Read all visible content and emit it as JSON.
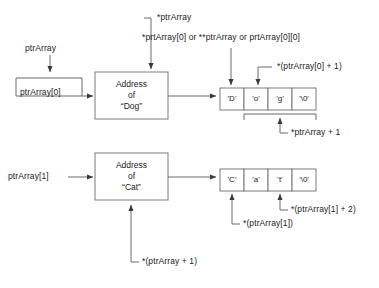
{
  "diagram": {
    "colors": {
      "line": "#6b6b6b",
      "box_border": "#7a7a7a",
      "arrow": "#3a3a3a",
      "text": "#1a1a1a",
      "background": "#ffffff"
    },
    "labels": {
      "ptr_array": "ptrArray",
      "ptr_array_0": "ptrArray[0]",
      "ptr_array_1": "ptrArray[1]",
      "deref_ptr_array": "*ptrArray",
      "deref_combo": "*prtArray[0] or **ptrArray or prtArray[0][0]",
      "deref_elem0_plus1": "*(ptrArray[0] + 1)",
      "deref_ptrarray_plus1_top": "*ptrArray + 1",
      "deref_ptrarray_plus1_bottom": "*(ptrArray + 1)",
      "deref_elem1": "*(ptrArray[1])",
      "deref_elem1_plus2": "*(ptrArray[1] + 2)"
    },
    "boxes": [
      {
        "name": "address-of-dog",
        "line1": "Address",
        "line2": "of",
        "line3": "“Dog”"
      },
      {
        "name": "address-of-cat",
        "line1": "Address",
        "line2": "of",
        "line3": "“Cat”"
      }
    ],
    "strings": [
      {
        "name": "dog-string",
        "cells": [
          "'D'",
          "'o'",
          "'g'",
          "'\\0'"
        ]
      },
      {
        "name": "cat-string",
        "cells": [
          "'C'",
          "'a'",
          "'t'",
          "'\\0'"
        ]
      }
    ]
  }
}
